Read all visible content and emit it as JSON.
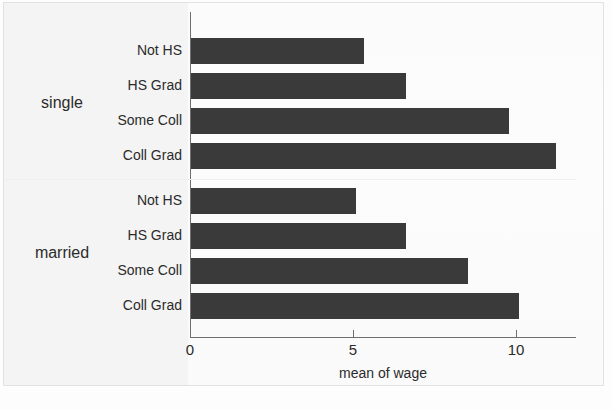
{
  "chart_data": {
    "type": "bar",
    "orientation": "horizontal",
    "title": "",
    "xlabel": "mean of wage",
    "ylabel": "",
    "xlim": [
      0,
      11.8
    ],
    "xticks": [
      0,
      5,
      10
    ],
    "xtick_labels": [
      "0",
      "5",
      "10"
    ],
    "grid": false,
    "legend": false,
    "panels": [
      {
        "name": "single",
        "categories": [
          "Not HS",
          "HS Grad",
          "Some Coll",
          "Coll Grad"
        ],
        "values": [
          5.3,
          6.6,
          9.75,
          11.2
        ]
      },
      {
        "name": "married",
        "categories": [
          "Not HS",
          "HS Grad",
          "Some Coll",
          "Coll Grad"
        ],
        "values": [
          5.05,
          6.6,
          8.5,
          10.05
        ]
      }
    ],
    "bar_color": "#3a3a3a",
    "axis_color": "#6f6f6f",
    "background_color": "#fdfdfd"
  },
  "axis": {
    "x_title": "mean of wage",
    "ticks": [
      {
        "label": "0",
        "value": 0
      },
      {
        "label": "5",
        "value": 5
      },
      {
        "label": "10",
        "value": 10
      }
    ]
  },
  "panels": [
    {
      "label": "single"
    },
    {
      "label": "married"
    }
  ],
  "rows": [
    {
      "label": "Not HS",
      "panel": "single",
      "value": 5.3
    },
    {
      "label": "HS Grad",
      "panel": "single",
      "value": 6.6
    },
    {
      "label": "Some Coll",
      "panel": "single",
      "value": 9.75
    },
    {
      "label": "Coll Grad",
      "panel": "single",
      "value": 11.2
    },
    {
      "label": "Not HS",
      "panel": "married",
      "value": 5.05
    },
    {
      "label": "HS Grad",
      "panel": "married",
      "value": 6.6
    },
    {
      "label": "Some Coll",
      "panel": "married",
      "value": 8.5
    },
    {
      "label": "Coll Grad",
      "panel": "married",
      "value": 10.05
    }
  ]
}
